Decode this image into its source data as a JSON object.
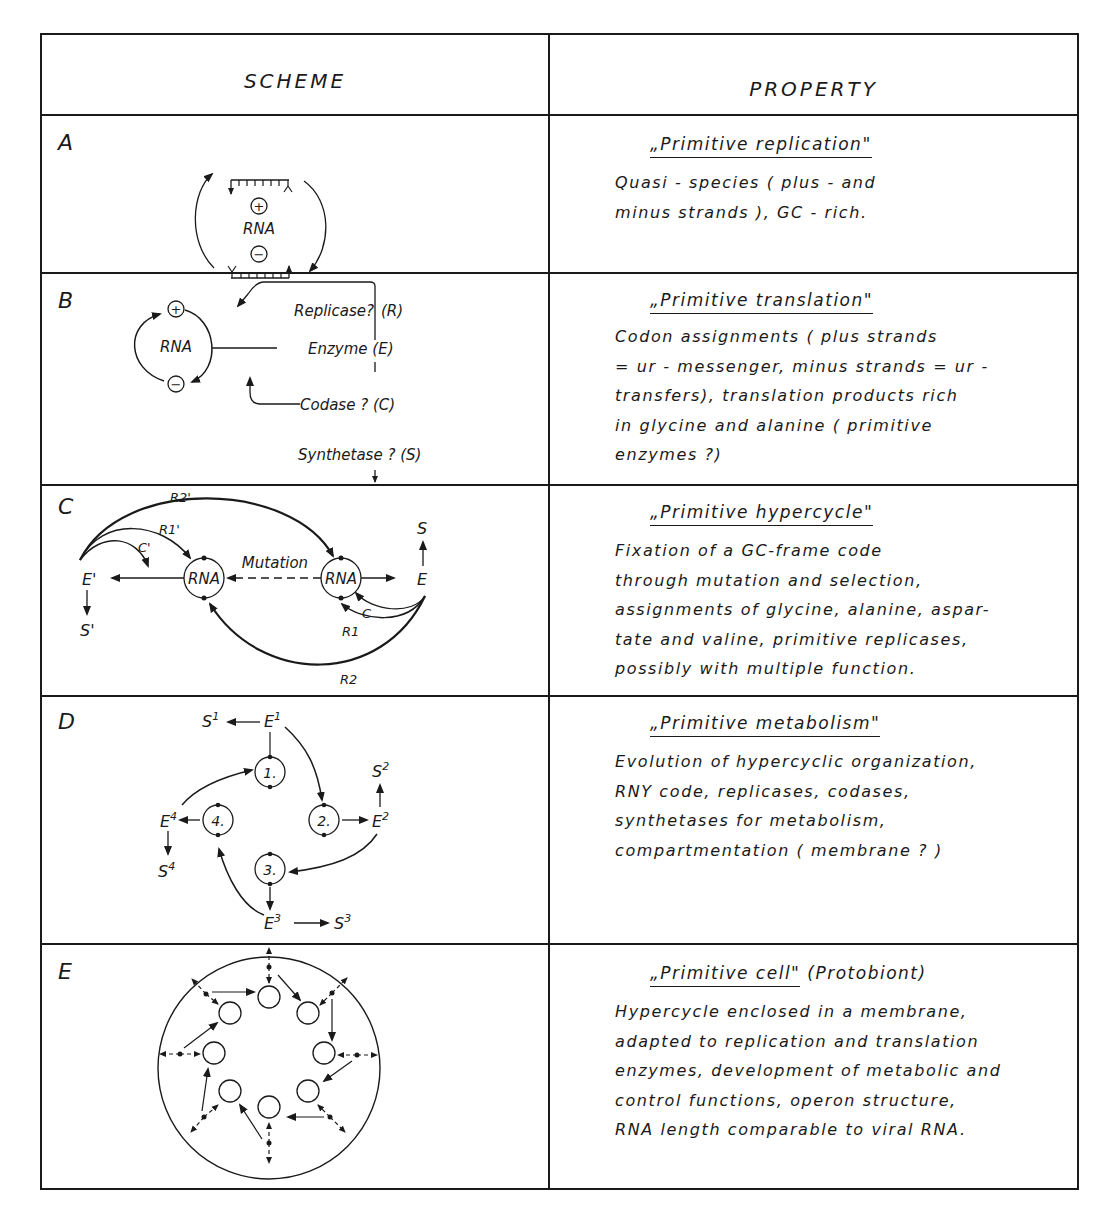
{
  "table": {
    "headers": {
      "scheme": "SCHEME",
      "property": "PROPERTY"
    },
    "rows": [
      {
        "letter": "A",
        "scheme": {
          "center_label": "RNA",
          "plus": "+",
          "minus": "−"
        },
        "title": "„Primitive replication\"",
        "title_extra": "",
        "lines": [
          "Quasi - species  ( plus - and",
          "minus  strands ),  GC - rich."
        ]
      },
      {
        "letter": "B",
        "scheme": {
          "center_label": "RNA",
          "plus": "+",
          "minus": "−",
          "replicase": "Replicase?",
          "replicase_abbr": "(R)",
          "enzyme": "Enzyme (E)",
          "codase": "Codase ? (C)",
          "synthetase": "Synthetase ? (S)"
        },
        "title": "„Primitive translation\"",
        "title_extra": "",
        "lines": [
          "Codon  assignments  ( plus  strands",
          "= ur - messenger,  minus  strands = ur -",
          "transfers), translation  products rich",
          "in glycine  and  alanine  ( primitive",
          "enzymes ?)"
        ]
      },
      {
        "letter": "C",
        "scheme": {
          "rna_left": "RNA",
          "rna_right": "RNA",
          "mutation": "Mutation",
          "e_prime": "E'",
          "e": "E",
          "s_prime": "S'",
          "s": "S",
          "r2_prime": "R2'",
          "r1_prime": "R1'",
          "c_prime": "C'",
          "c": "C",
          "r1": "R1",
          "r2": "R2"
        },
        "title": "„Primitive hypercycle\"",
        "title_extra": "",
        "lines": [
          "Fixation  of a GC-frame code",
          "through  mutation and  selection,",
          "assignments of glycine, alanine, aspar-",
          "tate  and  valine, primitive  replicases,",
          "possibly  with  multiple  function."
        ]
      },
      {
        "letter": "D",
        "scheme": {
          "nodes": [
            "1.",
            "2.",
            "3.",
            "4."
          ],
          "enzymes": [
            "E1",
            "E2",
            "E3",
            "E4"
          ],
          "products": [
            "S1",
            "S2",
            "S3",
            "S4"
          ]
        },
        "title": "„Primitive metabolism\"",
        "title_extra": "",
        "lines": [
          "Evolution  of  hypercyclic  organization,",
          "RNY  code, replicases, codases,",
          "synthetases  for  metabolism,",
          "compartmentation  ( membrane ? )"
        ]
      },
      {
        "letter": "E",
        "scheme": {
          "description": "membrane-enclosed hypercycle of 8 self-replicating RNA units"
        },
        "title": "„Primitive cell\"",
        "title_extra": " (Protobiont)",
        "lines": [
          "Hypercycle  enclosed  in a  membrane,",
          "adapted  to  replication and  translation",
          "enzymes, development  of  metabolic  and",
          "control  functions,  operon  structure,",
          "RNA  length  comparable  to viral  RNA."
        ]
      }
    ]
  },
  "colors": {
    "ink": "#1a1a1a",
    "paper": "#ffffff"
  }
}
